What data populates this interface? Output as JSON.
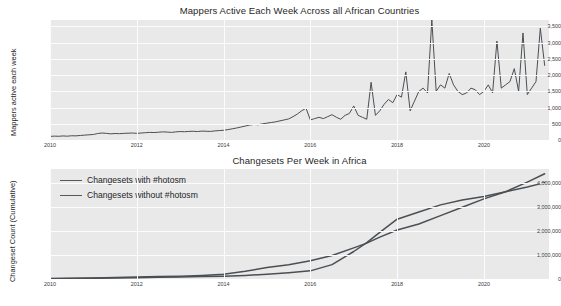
{
  "figure": {
    "background": "#ffffff",
    "plot_background": "#e9e9e9",
    "grid_color": "#fcfcfc",
    "line_color": "#4a4f54"
  },
  "chart_data": [
    {
      "type": "line",
      "title": "Mappers Active Each Week Across all African Countries",
      "xlabel": "",
      "ylabel": "Mappers active each week",
      "xlim": [
        2010,
        2021.5
      ],
      "ylim": [
        0,
        3700
      ],
      "xticks": [
        "2010",
        "2012",
        "2014",
        "2016",
        "2018",
        "2020"
      ],
      "xtick_values": [
        2010,
        2012,
        2014,
        2016,
        2018,
        2020
      ],
      "yticks": [
        "0",
        "500",
        "1,000",
        "1,500",
        "2,000",
        "2,500",
        "3,000",
        "3,500"
      ],
      "ytick_values": [
        0,
        500,
        1000,
        1500,
        2000,
        2500,
        3000,
        3500
      ],
      "grid": true,
      "legend": null,
      "series": [
        {
          "name": "Mappers active each week",
          "x": [
            2010.0,
            2010.1,
            2010.2,
            2010.3,
            2010.4,
            2010.5,
            2010.6,
            2010.7,
            2010.8,
            2010.9,
            2011.0,
            2011.1,
            2011.2,
            2011.3,
            2011.4,
            2011.5,
            2011.6,
            2011.7,
            2011.8,
            2011.9,
            2012.0,
            2012.1,
            2012.2,
            2012.3,
            2012.4,
            2012.5,
            2012.6,
            2012.7,
            2012.8,
            2012.9,
            2013.0,
            2013.1,
            2013.2,
            2013.3,
            2013.4,
            2013.5,
            2013.6,
            2013.7,
            2013.8,
            2013.9,
            2014.0,
            2014.1,
            2014.2,
            2014.3,
            2014.4,
            2014.5,
            2014.6,
            2014.7,
            2014.8,
            2014.9,
            2015.0,
            2015.1,
            2015.2,
            2015.3,
            2015.4,
            2015.5,
            2015.6,
            2015.7,
            2015.8,
            2015.9,
            2016.0,
            2016.1,
            2016.2,
            2016.3,
            2016.4,
            2016.5,
            2016.6,
            2016.7,
            2016.8,
            2016.9,
            2017.0,
            2017.1,
            2017.2,
            2017.3,
            2017.4,
            2017.5,
            2017.6,
            2017.7,
            2017.8,
            2017.9,
            2018.0,
            2018.1,
            2018.2,
            2018.3,
            2018.4,
            2018.5,
            2018.6,
            2018.7,
            2018.8,
            2018.9,
            2019.0,
            2019.1,
            2019.2,
            2019.3,
            2019.4,
            2019.5,
            2019.6,
            2019.7,
            2019.8,
            2019.9,
            2020.0,
            2020.1,
            2020.2,
            2020.3,
            2020.4,
            2020.5,
            2020.6,
            2020.7,
            2020.8,
            2020.9,
            2021.0,
            2021.1,
            2021.2,
            2021.3,
            2021.4
          ],
          "values": [
            110,
            120,
            115,
            125,
            118,
            130,
            128,
            140,
            150,
            160,
            170,
            200,
            215,
            205,
            190,
            200,
            195,
            205,
            210,
            215,
            205,
            215,
            225,
            235,
            230,
            240,
            250,
            245,
            235,
            250,
            260,
            255,
            265,
            270,
            260,
            275,
            270,
            265,
            280,
            290,
            300,
            320,
            345,
            370,
            400,
            430,
            460,
            480,
            470,
            500,
            520,
            540,
            560,
            590,
            620,
            650,
            720,
            800,
            900,
            980,
            620,
            660,
            700,
            660,
            720,
            780,
            700,
            640,
            760,
            820,
            1050,
            760,
            700,
            640,
            1780,
            760,
            900,
            1100,
            1250,
            1150,
            1400,
            1320,
            2100,
            900,
            1200,
            1500,
            1600,
            1450,
            3700,
            1500,
            1700,
            1600,
            2050,
            1700,
            1500,
            1400,
            1450,
            1600,
            1550,
            1400,
            1500,
            1700,
            1450,
            3050,
            1600,
            1700,
            1800,
            2200,
            1500,
            3300,
            1400,
            1600,
            1800,
            3450,
            2300
          ]
        }
      ]
    },
    {
      "type": "line",
      "title": "Changesets Per Week in Africa",
      "xlabel": "",
      "ylabel": "Changeset Count (Cumulative)",
      "xlim": [
        2010,
        2021.5
      ],
      "ylim": [
        0,
        4600000
      ],
      "xticks": [
        "2010",
        "2012",
        "2014",
        "2016",
        "2018",
        "2020"
      ],
      "xtick_values": [
        2010,
        2012,
        2014,
        2016,
        2018,
        2020
      ],
      "yticks": [
        "0",
        "1,000,000",
        "2,000,000",
        "3,000,000",
        "4,000,000"
      ],
      "ytick_values": [
        0,
        1000000,
        2000000,
        3000000,
        4000000
      ],
      "grid": true,
      "legend_position": "upper left",
      "series": [
        {
          "name": "Changesets with #hotosm",
          "x": [
            2010,
            2010.5,
            2011,
            2011.5,
            2012,
            2012.5,
            2013,
            2013.5,
            2014,
            2014.5,
            2015,
            2015.5,
            2016,
            2016.5,
            2017,
            2017.3,
            2017.6,
            2018,
            2018.5,
            2019,
            2019.5,
            2020,
            2020.5,
            2021,
            2021.4
          ],
          "values": [
            20000,
            30000,
            45000,
            60000,
            80000,
            100000,
            120000,
            150000,
            200000,
            320000,
            480000,
            600000,
            760000,
            980000,
            1300000,
            1500000,
            1750000,
            2050000,
            2300000,
            2650000,
            3000000,
            3350000,
            3650000,
            4050000,
            4400000
          ]
        },
        {
          "name": "Changesets without #hotosm",
          "x": [
            2010,
            2010.5,
            2011,
            2011.5,
            2012,
            2012.5,
            2013,
            2013.5,
            2014,
            2014.5,
            2015,
            2015.5,
            2016,
            2016.5,
            2017,
            2017.3,
            2017.6,
            2018,
            2018.5,
            2019,
            2019.5,
            2020,
            2020.5,
            2021,
            2021.4
          ],
          "values": [
            15000,
            22000,
            32000,
            42000,
            55000,
            70000,
            85000,
            100000,
            120000,
            150000,
            200000,
            260000,
            340000,
            600000,
            1150000,
            1520000,
            1950000,
            2500000,
            2800000,
            3100000,
            3300000,
            3450000,
            3650000,
            3850000,
            4030000
          ]
        }
      ]
    }
  ]
}
